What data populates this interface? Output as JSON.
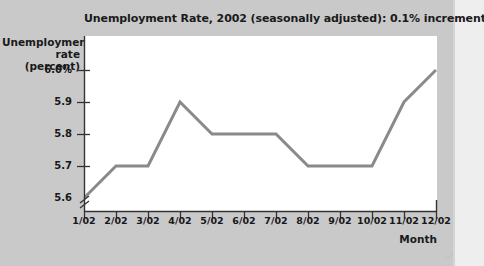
{
  "chart_data": {
    "type": "line",
    "title": "Unemployment Rate, 2002 (seasonally adjusted): 0.1% increments",
    "xlabel": "Month",
    "ylabel": "Unemployment rate (percent)",
    "ylabel_line1": "Unemployment",
    "ylabel_line2": "rate (percent)",
    "categories": [
      "1/02",
      "2/02",
      "3/02",
      "4/02",
      "5/02",
      "6/02",
      "7/02",
      "8/02",
      "9/02",
      "10/02",
      "11/02",
      "12/02"
    ],
    "values": [
      5.6,
      5.7,
      5.7,
      5.9,
      5.8,
      5.8,
      5.8,
      5.7,
      5.7,
      5.7,
      5.9,
      6.0
    ],
    "series": [
      {
        "name": "Unemployment rate",
        "values": [
          5.6,
          5.7,
          5.7,
          5.9,
          5.8,
          5.8,
          5.8,
          5.7,
          5.7,
          5.7,
          5.9,
          6.0
        ]
      }
    ],
    "ylim": [
      5.6,
      6.0
    ],
    "ytick_values": [
      6.0,
      5.9,
      5.8,
      5.7,
      5.6
    ],
    "ytick_labels": [
      "6.0%",
      "5.9",
      "5.8",
      "5.7",
      "5.6"
    ],
    "y_axis_break": true,
    "y_axis_break_note": "zigzag break below 5.6",
    "grid": false,
    "legend": "none",
    "line_color": "#8a8a8a",
    "plot_background": "#ffffff",
    "page_background": "#c9c9c9",
    "text_color": "#1a1a1a"
  }
}
